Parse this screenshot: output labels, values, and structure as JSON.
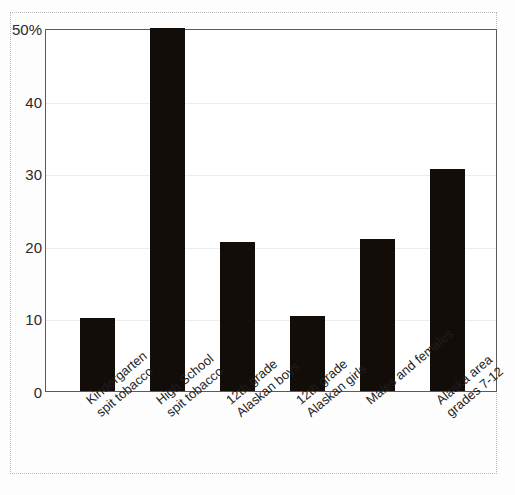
{
  "chart_data": {
    "type": "bar",
    "title": "",
    "subtitle": "",
    "xlabel": "",
    "ylabel": "",
    "ylim": [
      0,
      50
    ],
    "yticks": [
      0,
      10,
      20,
      30,
      40,
      50
    ],
    "ytick_labels": [
      "0",
      "10",
      "20",
      "30",
      "40",
      "50%"
    ],
    "grid": true,
    "legend": false,
    "bar_color": "#120d09",
    "categories": [
      "Kindergarten spit tobacco",
      "High School spit tobacco",
      "12th grade Alaskan boys",
      "12th grade Alaskan girls",
      "Males and females",
      "Alaska area grades 7-12"
    ],
    "category_lines": [
      [
        "Kindergarten",
        "spit tobacco"
      ],
      [
        "High School",
        "spit tobacco"
      ],
      [
        "12th grade",
        "Alaskan boys"
      ],
      [
        "12th grade",
        "Alaskan girls"
      ],
      [
        "Males and females",
        ""
      ],
      [
        "Alaska area",
        "grades 7-12"
      ]
    ],
    "values": [
      10.0,
      50.0,
      20.5,
      10.3,
      20.9,
      30.6
    ]
  }
}
